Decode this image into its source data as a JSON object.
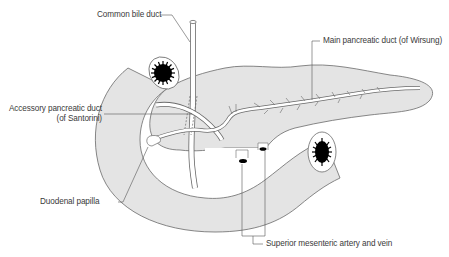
{
  "diagram": {
    "colors": {
      "tissue_fill": "#e4e4e4",
      "outline": "#6a6a6a",
      "duct_fill": "#ffffff",
      "lumen": "#000000",
      "label_text": "#3a3a3a",
      "leader_line": "#555555"
    },
    "labels": {
      "common_bile_duct": "Common bile duct",
      "main_pancreatic_duct": "Main pancreatic duct (of Wirsung)",
      "accessory_duct_line1": "Accessory pancreatic duct",
      "accessory_duct_line2": "(of Santorini)",
      "duodenal_papilla": "Duodenal papilla",
      "sma_smv": "Superior mesenteric artery and vein"
    }
  }
}
